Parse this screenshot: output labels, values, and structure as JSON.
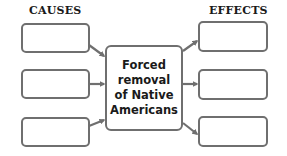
{
  "diagram": {
    "type": "cause-effect graphic organizer",
    "causes": {
      "heading": "CAUSES",
      "boxes": [
        "",
        "",
        ""
      ]
    },
    "center": {
      "lines": [
        "Forced",
        "removal",
        "of Native",
        "Americans"
      ]
    },
    "effects": {
      "heading": "EFFECTS",
      "boxes": [
        "",
        "",
        ""
      ]
    },
    "colors": {
      "border": "#6f6f6f",
      "text": "#1a1a1a",
      "background": "#ffffff"
    }
  }
}
